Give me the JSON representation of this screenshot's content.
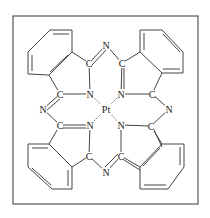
{
  "diagram": {
    "frame": {
      "x": 13,
      "y": 16,
      "width": 185,
      "height": 188
    },
    "metal": {
      "label": "Pt",
      "x": 106,
      "y": 109
    },
    "atoms": [
      {
        "id": "Nb_top",
        "label": "N",
        "x": 106,
        "y": 45
      },
      {
        "id": "Nb_left",
        "label": "N",
        "x": 43,
        "y": 109
      },
      {
        "id": "Nb_right",
        "label": "N",
        "x": 169,
        "y": 109
      },
      {
        "id": "Nb_bottom",
        "label": "N",
        "x": 106,
        "y": 172
      },
      {
        "id": "Ni_tl",
        "label": "N",
        "x": 90,
        "y": 94
      },
      {
        "id": "Ni_tr",
        "label": "N",
        "x": 121,
        "y": 94
      },
      {
        "id": "Ni_bl",
        "label": "N",
        "x": 90,
        "y": 125
      },
      {
        "id": "Ni_br",
        "label": "N",
        "x": 121,
        "y": 125
      },
      {
        "id": "C_t1",
        "label": "C",
        "x": 89,
        "y": 63
      },
      {
        "id": "C_t2",
        "label": "C",
        "x": 122,
        "y": 63
      },
      {
        "id": "C_l1",
        "label": "C",
        "x": 60,
        "y": 94
      },
      {
        "id": "C_l2",
        "label": "C",
        "x": 60,
        "y": 125
      },
      {
        "id": "C_r1",
        "label": "C",
        "x": 152,
        "y": 94
      },
      {
        "id": "C_r2",
        "label": "C",
        "x": 151,
        "y": 126
      },
      {
        "id": "C_b1",
        "label": "C",
        "x": 89,
        "y": 156
      },
      {
        "id": "C_b2",
        "label": "C",
        "x": 121,
        "y": 156
      }
    ]
  }
}
